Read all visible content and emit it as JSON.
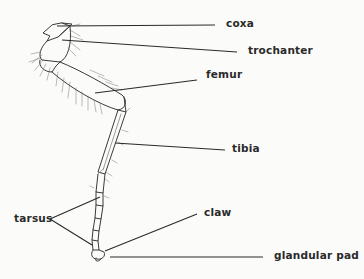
{
  "diagram": {
    "labels": {
      "coxa": "coxa",
      "trochanter": "trochanter",
      "femur": "femur",
      "tibia": "tibia",
      "tarsus": "tarsus",
      "claw": "claw",
      "glandular_pad": "glandular pad"
    },
    "colors": {
      "ink": "#2a2a2a",
      "background": "#fbfbf9"
    }
  }
}
